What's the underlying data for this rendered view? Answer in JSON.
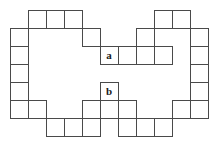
{
  "figure": {
    "background_color": "#ffffff",
    "stroke_color": "#4a4a4a",
    "label_color": "#1a1a1a",
    "stroke_width": 1,
    "cell_size": 18,
    "origin": {
      "x": 10,
      "y": 10
    },
    "grid_columns": 11,
    "grid_rows": 7,
    "cell_count": 46,
    "cells": [
      {
        "col": 1,
        "row": 0,
        "label": ""
      },
      {
        "col": 2,
        "row": 0,
        "label": ""
      },
      {
        "col": 3,
        "row": 0,
        "label": ""
      },
      {
        "col": 8,
        "row": 0,
        "label": ""
      },
      {
        "col": 9,
        "row": 0,
        "label": ""
      },
      {
        "col": 0,
        "row": 1,
        "label": ""
      },
      {
        "col": 4,
        "row": 1,
        "label": ""
      },
      {
        "col": 7,
        "row": 1,
        "label": ""
      },
      {
        "col": 10,
        "row": 1,
        "label": ""
      },
      {
        "col": 0,
        "row": 2,
        "label": ""
      },
      {
        "col": 5,
        "row": 2,
        "label": "a"
      },
      {
        "col": 6,
        "row": 2,
        "label": ""
      },
      {
        "col": 7,
        "row": 2,
        "label": ""
      },
      {
        "col": 8,
        "row": 2,
        "label": ""
      },
      {
        "col": 10,
        "row": 2,
        "label": ""
      },
      {
        "col": 0,
        "row": 3,
        "label": ""
      },
      {
        "col": 10,
        "row": 3,
        "label": ""
      },
      {
        "col": 0,
        "row": 4,
        "label": ""
      },
      {
        "col": 5,
        "row": 4,
        "label": "b"
      },
      {
        "col": 10,
        "row": 4,
        "label": ""
      },
      {
        "col": 0,
        "row": 5,
        "label": ""
      },
      {
        "col": 10,
        "row": 5,
        "label": ""
      },
      {
        "col": 1,
        "row": 5,
        "label": ""
      },
      {
        "col": 4,
        "row": 5,
        "label": ""
      },
      {
        "col": 5,
        "row": 5,
        "label": ""
      },
      {
        "col": 6,
        "row": 5,
        "label": ""
      },
      {
        "col": 9,
        "row": 5,
        "label": ""
      },
      {
        "col": 2,
        "row": 6,
        "label": ""
      },
      {
        "col": 3,
        "row": 6,
        "label": ""
      },
      {
        "col": 4,
        "row": 6,
        "label": ""
      },
      {
        "col": 6,
        "row": 6,
        "label": ""
      },
      {
        "col": 7,
        "row": 6,
        "label": ""
      },
      {
        "col": 8,
        "row": 6,
        "label": ""
      }
    ],
    "labels": [
      {
        "text": "a",
        "col": 5,
        "row": 2,
        "name": "cell-label-a"
      },
      {
        "text": "b",
        "col": 5,
        "row": 4,
        "name": "cell-label-b"
      }
    ]
  }
}
